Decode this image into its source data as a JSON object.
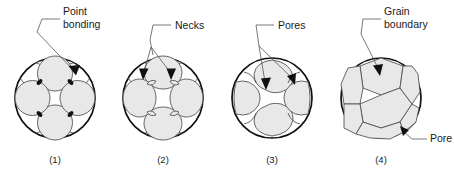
{
  "figure": {
    "background_color": "#ffffff",
    "grain_fill_color": "#e8e8e8",
    "grain_stroke_color": "#4d4d4d",
    "outline_color": "#111111",
    "leader_color": "#555555",
    "text_color": "#1a1a1a"
  },
  "panels": [
    {
      "id": "panel-1",
      "caption": "(1)",
      "label_lines": [
        "Point",
        "bonding"
      ],
      "label_full": "Point bonding",
      "description": "Loose spherical particles touching at points"
    },
    {
      "id": "panel-2",
      "caption": "(2)",
      "label_lines": [
        "Necks"
      ],
      "label_full": "Necks",
      "description": "Necks forming between particles"
    },
    {
      "id": "panel-3",
      "caption": "(3)",
      "label_lines": [
        "Pores"
      ],
      "label_full": "Pores",
      "description": "Grains coalescing, pores shrinking"
    },
    {
      "id": "panel-4",
      "caption": "(4)",
      "label_lines": [
        "Grain",
        "boundary"
      ],
      "label_full": "Grain boundary",
      "secondary_label": "Pore",
      "description": "Dense polygonal grains with grain boundaries and isolated pore"
    }
  ]
}
